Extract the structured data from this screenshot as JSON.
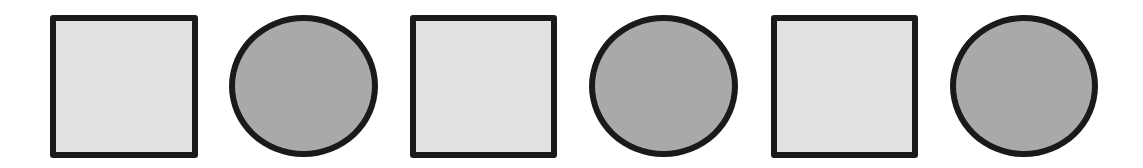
{
  "diagram": {
    "pattern": [
      "square",
      "circle",
      "square",
      "circle",
      "square",
      "circle"
    ],
    "colors": {
      "background": "#ffffff",
      "stroke": "#1a1a1a",
      "square_fill": "#e2e2e2",
      "circle_fill": "#a9a9a9"
    },
    "stroke_width": 6,
    "shapes": [
      {
        "type": "square",
        "x": 50,
        "y": 15,
        "w": 148,
        "h": 143
      },
      {
        "type": "circle",
        "x": 229,
        "y": 15,
        "w": 149,
        "h": 142
      },
      {
        "type": "square",
        "x": 410,
        "y": 15,
        "w": 147,
        "h": 143
      },
      {
        "type": "circle",
        "x": 589,
        "y": 15,
        "w": 149,
        "h": 142
      },
      {
        "type": "square",
        "x": 771,
        "y": 15,
        "w": 147,
        "h": 143
      },
      {
        "type": "circle",
        "x": 950,
        "y": 15,
        "w": 148,
        "h": 142
      }
    ]
  }
}
